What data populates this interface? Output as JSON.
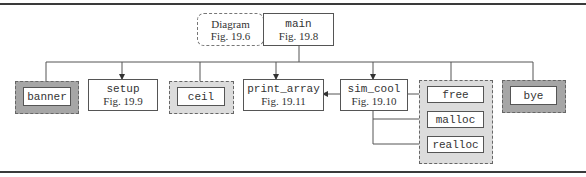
{
  "diagram": {
    "top_nodes": [
      {
        "id": "diagram",
        "line1": "Diagram",
        "line2": "Fig. 19.6",
        "style": "dashed-rounded"
      },
      {
        "id": "main",
        "line1": "main",
        "line2": "Fig. 19.8",
        "style": "solid"
      }
    ],
    "children": [
      {
        "id": "banner",
        "label": "banner",
        "group": "dark-gray-dashed"
      },
      {
        "id": "setup",
        "line1": "setup",
        "line2": "Fig. 19.9",
        "style": "solid"
      },
      {
        "id": "ceil",
        "label": "ceil",
        "group": "light-gray-dashed"
      },
      {
        "id": "print_array",
        "line1": "print_array",
        "line2": "Fig. 19.11",
        "style": "solid"
      },
      {
        "id": "sim_cool",
        "line1": "sim_cool",
        "line2": "Fig. 19.10",
        "style": "solid"
      },
      {
        "id": "bye",
        "label": "bye",
        "group": "dark-gray-dashed"
      }
    ],
    "memory_group": {
      "style": "light-gray-dashed",
      "items": [
        {
          "id": "free",
          "label": "free"
        },
        {
          "id": "malloc",
          "label": "malloc"
        },
        {
          "id": "realloc",
          "label": "realloc"
        }
      ]
    },
    "edges": [
      {
        "from": "main",
        "to": "banner"
      },
      {
        "from": "main",
        "to": "setup"
      },
      {
        "from": "main",
        "to": "ceil"
      },
      {
        "from": "main",
        "to": "print_array"
      },
      {
        "from": "main",
        "to": "sim_cool"
      },
      {
        "from": "main",
        "to": "free"
      },
      {
        "from": "main",
        "to": "bye"
      },
      {
        "from": "sim_cool",
        "to": "print_array"
      },
      {
        "from": "sim_cool",
        "to": "free"
      },
      {
        "from": "sim_cool",
        "to": "malloc"
      },
      {
        "from": "sim_cool",
        "to": "realloc"
      }
    ],
    "colors": {
      "dark_group_fill": "#a6a6a6",
      "light_group_fill": "#dcdcdc",
      "line": "#555555",
      "rule": "#3a3a3a"
    }
  }
}
